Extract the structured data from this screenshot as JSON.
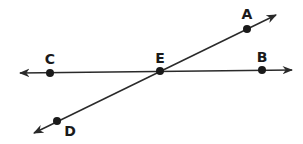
{
  "diagram": {
    "type": "geometry-intersecting-lines",
    "colors": {
      "line": "#2a2a2a",
      "point": "#1a1a1a",
      "label": "#1a1a1a",
      "background": "#ffffff"
    },
    "points": [
      {
        "id": "A",
        "label": "A",
        "x": 247,
        "y": 29,
        "label_x": 247,
        "label_y": 19
      },
      {
        "id": "B",
        "label": "B",
        "x": 262,
        "y": 70,
        "label_x": 262,
        "label_y": 62
      },
      {
        "id": "C",
        "label": "C",
        "x": 50,
        "y": 73,
        "label_x": 50,
        "label_y": 64
      },
      {
        "id": "D",
        "label": "D",
        "x": 57,
        "y": 121,
        "label_x": 70,
        "label_y": 136
      },
      {
        "id": "E",
        "label": "E",
        "x": 160,
        "y": 71,
        "label_x": 160,
        "label_y": 63
      }
    ],
    "lines": [
      {
        "name": "line-CB",
        "through": [
          "C",
          "E",
          "B"
        ],
        "x1": 20,
        "y1": 73,
        "x2": 292,
        "y2": 70
      },
      {
        "name": "line-DA",
        "through": [
          "D",
          "E",
          "A"
        ],
        "x1": 34,
        "y1": 133,
        "x2": 276,
        "y2": 15
      }
    ]
  }
}
